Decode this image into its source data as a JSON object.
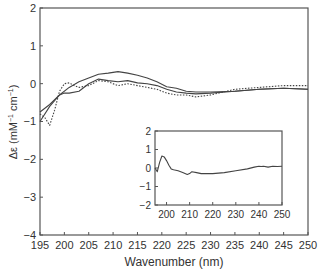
{
  "chart_data": [
    {
      "type": "line",
      "title": "",
      "xlabel": "Wavenumber (nm)",
      "ylabel": "Δε (mM⁻¹ cm⁻¹)",
      "xlim": [
        195,
        250
      ],
      "ylim": [
        -4,
        2
      ],
      "xticks": [
        195,
        200,
        205,
        210,
        215,
        220,
        225,
        230,
        235,
        240,
        245,
        250
      ],
      "yticks": [
        2,
        1,
        0,
        -1,
        -2,
        -3,
        -4
      ],
      "grid": false,
      "legend": null,
      "series": [
        {
          "name": "solid-upper",
          "style": "solid",
          "x": [
            195,
            197,
            199,
            201,
            203,
            205,
            207,
            209,
            211,
            213,
            215,
            217,
            219,
            221,
            223,
            225,
            227,
            230,
            235,
            240,
            245,
            250
          ],
          "values": [
            -0.75,
            -0.55,
            -0.3,
            -0.1,
            0.05,
            0.15,
            0.25,
            0.28,
            0.32,
            0.28,
            0.22,
            0.15,
            0.05,
            -0.08,
            -0.12,
            -0.2,
            -0.22,
            -0.22,
            -0.2,
            -0.15,
            -0.12,
            -0.15
          ]
        },
        {
          "name": "solid-lower",
          "style": "solid",
          "x": [
            195,
            197,
            199,
            200,
            201,
            203,
            205,
            207,
            209,
            211,
            213,
            215,
            217,
            219,
            221,
            223,
            225,
            227,
            230,
            235,
            240,
            245,
            250
          ],
          "values": [
            -1.0,
            -0.6,
            -0.3,
            -0.25,
            -0.25,
            -0.2,
            0.0,
            0.12,
            0.08,
            0.05,
            0.08,
            0.02,
            0.0,
            -0.05,
            -0.15,
            -0.22,
            -0.25,
            -0.27,
            -0.25,
            -0.2,
            -0.15,
            -0.12,
            -0.15
          ]
        },
        {
          "name": "dotted",
          "style": "dotted",
          "x": [
            195,
            196,
            197,
            198,
            199,
            200,
            201,
            202,
            203,
            205,
            207,
            209,
            211,
            213,
            215,
            217,
            219,
            221,
            223,
            225,
            227,
            230,
            235,
            240,
            245,
            250
          ],
          "values": [
            -0.8,
            -0.9,
            -1.1,
            -0.7,
            -0.2,
            0.0,
            0.02,
            -0.05,
            -0.1,
            -0.05,
            0.08,
            0.05,
            -0.05,
            0.0,
            -0.05,
            -0.1,
            -0.15,
            -0.25,
            -0.3,
            -0.3,
            -0.35,
            -0.3,
            -0.15,
            -0.1,
            -0.05,
            -0.05
          ]
        }
      ]
    },
    {
      "type": "line",
      "title": "",
      "inset": true,
      "xlabel": "",
      "ylabel": "",
      "xlim": [
        195,
        250
      ],
      "ylim": [
        -2,
        2
      ],
      "xticks": [
        200,
        210,
        220,
        230,
        240,
        250
      ],
      "yticks": [
        2,
        1,
        0,
        -1,
        -2
      ],
      "grid": false,
      "series": [
        {
          "name": "difference",
          "style": "solid",
          "x": [
            195,
            196,
            197,
            198,
            199,
            200,
            201,
            202,
            203,
            205,
            207,
            209,
            210,
            211,
            213,
            215,
            220,
            225,
            230,
            235,
            238,
            240,
            241,
            242,
            244,
            246,
            248,
            250
          ],
          "values": [
            0.0,
            -0.2,
            0.3,
            0.65,
            0.6,
            0.4,
            0.15,
            -0.05,
            -0.1,
            -0.15,
            -0.25,
            -0.35,
            -0.3,
            -0.2,
            -0.25,
            -0.3,
            -0.3,
            -0.25,
            -0.15,
            -0.05,
            0.05,
            0.1,
            0.08,
            0.1,
            0.05,
            0.1,
            0.08,
            0.1
          ]
        }
      ]
    }
  ],
  "labels": {
    "xlabel": "Wavenumber (nm)",
    "ylabel_main": "Δε (mM",
    "ylabel_sup1": "−1",
    "ylabel_mid": " cm",
    "ylabel_sup2": "−1",
    "ylabel_end": ")"
  },
  "colors": {
    "axis": "#555555",
    "line": "#444444",
    "text": "#333333"
  }
}
